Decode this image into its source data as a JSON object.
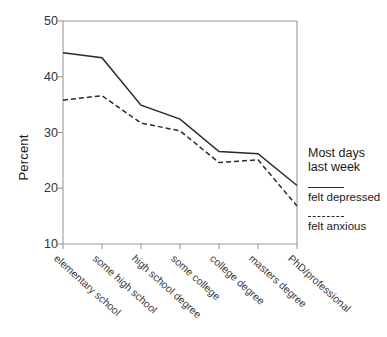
{
  "chart_data": {
    "type": "line",
    "title": "",
    "xlabel": "",
    "ylabel": "Percent",
    "ylim": [
      10,
      50
    ],
    "yticks": [
      10,
      20,
      30,
      40,
      50
    ],
    "grid": false,
    "legend_position": "right",
    "legend_title_line1": "Most days",
    "legend_title_line2": "last week",
    "categories": [
      "elementary school",
      "some high school",
      "high school degree",
      "some college",
      "college degree",
      "masters degree",
      "PhD/professional"
    ],
    "series": [
      {
        "name": "felt depressed",
        "style": "solid",
        "color": "#2a2a2a",
        "values": [
          44.3,
          43.4,
          34.9,
          32.4,
          26.6,
          26.2,
          20.5
        ]
      },
      {
        "name": "felt anxious",
        "style": "dashed",
        "color": "#2a2a2a",
        "values": [
          35.8,
          36.6,
          31.7,
          30.3,
          24.6,
          25.1,
          16.8
        ]
      }
    ]
  },
  "axis": {
    "y_tick_labels": [
      "50",
      "40",
      "30",
      "20",
      "10"
    ]
  }
}
